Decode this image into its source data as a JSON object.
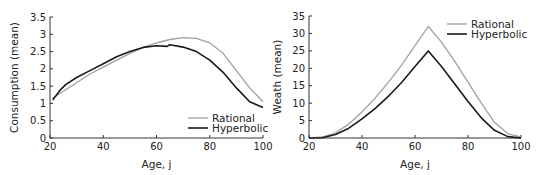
{
  "chart_data": [
    {
      "type": "line",
      "title": "",
      "xlabel": "Age, j",
      "ylabel": "Consumption (mean)",
      "xlim": [
        20,
        100
      ],
      "ylim": [
        0,
        3.5
      ],
      "xticks": [
        "20",
        "40",
        "60",
        "80",
        "100"
      ],
      "yticks": [
        "0",
        "0.5",
        "1",
        "1.5",
        "2",
        "2.5",
        "3",
        "3.5"
      ],
      "grid": false,
      "legend_position": "lower right",
      "series": [
        {
          "name": "Rational",
          "color": "#a0a0a0",
          "x": [
            21,
            25,
            30,
            35,
            40,
            45,
            50,
            55,
            60,
            65,
            70,
            75,
            80,
            85,
            90,
            95,
            100
          ],
          "y": [
            1.15,
            1.35,
            1.6,
            1.85,
            2.05,
            2.25,
            2.45,
            2.62,
            2.75,
            2.85,
            2.9,
            2.88,
            2.75,
            2.45,
            1.95,
            1.45,
            1.05
          ]
        },
        {
          "name": "Hyperbolic",
          "color": "#1a1a1a",
          "x": [
            21,
            24,
            26,
            30,
            35,
            40,
            45,
            50,
            55,
            60,
            64,
            65,
            70,
            75,
            80,
            85,
            90,
            95,
            100
          ],
          "y": [
            1.1,
            1.4,
            1.55,
            1.75,
            1.95,
            2.15,
            2.35,
            2.5,
            2.62,
            2.67,
            2.65,
            2.7,
            2.63,
            2.5,
            2.25,
            1.9,
            1.45,
            1.05,
            0.88
          ]
        }
      ]
    },
    {
      "type": "line",
      "title": "",
      "xlabel": "Age, j",
      "ylabel": "Weath (mean)",
      "xlim": [
        20,
        100
      ],
      "ylim": [
        0,
        35
      ],
      "xticks": [
        "20",
        "40",
        "60",
        "80",
        "100"
      ],
      "yticks": [
        "0",
        "5",
        "10",
        "15",
        "20",
        "25",
        "30",
        "35"
      ],
      "grid": false,
      "legend_position": "upper right",
      "series": [
        {
          "name": "Rational",
          "color": "#a0a0a0",
          "x": [
            20,
            25,
            30,
            35,
            40,
            45,
            50,
            55,
            60,
            65,
            70,
            75,
            80,
            85,
            90,
            95,
            100
          ],
          "y": [
            0,
            0.3,
            1.5,
            4,
            7.5,
            11.5,
            16,
            21,
            26.5,
            32,
            27.5,
            22,
            16,
            10,
            4.5,
            1.2,
            0.3
          ]
        },
        {
          "name": "Hyperbolic",
          "color": "#1a1a1a",
          "x": [
            20,
            25,
            30,
            35,
            40,
            45,
            50,
            55,
            60,
            65,
            70,
            75,
            80,
            85,
            90,
            95,
            100
          ],
          "y": [
            0,
            0.1,
            1,
            2.8,
            5.5,
            8.5,
            12,
            16,
            20.5,
            25,
            20.5,
            15.5,
            10.5,
            5.8,
            2.2,
            0.4,
            0
          ]
        }
      ]
    }
  ]
}
